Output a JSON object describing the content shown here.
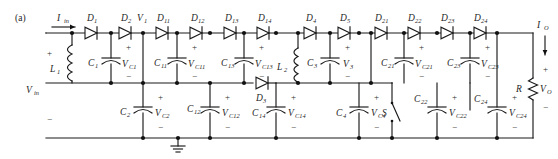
{
  "figure": {
    "panel_label": "(a)",
    "type": "schematic-circuit-diagram"
  },
  "colors": {
    "wire": "#1a1a1a",
    "node": "#111111",
    "text": "#262626",
    "background": "#ffffff"
  },
  "labels": {
    "i_in": "I",
    "i_in_sub": "in",
    "i_out": "I",
    "i_out_sub": "O",
    "v_in": "V",
    "v_in_sub": "in",
    "v_out": "V",
    "v_out_sub": "O",
    "plus": "+",
    "minus": "−",
    "resistor": "R",
    "switch": "S",
    "v1": "V",
    "v1_sub": "1",
    "v3": "V",
    "v3_sub": "3"
  },
  "diodes": [
    {
      "name": "D",
      "sub": "1",
      "x": 92,
      "y": 33
    },
    {
      "name": "D",
      "sub": "2",
      "x": 126,
      "y": 33
    },
    {
      "name": "D",
      "sub": "11",
      "x": 164,
      "y": 33
    },
    {
      "name": "D",
      "sub": "12",
      "x": 199,
      "y": 33
    },
    {
      "name": "D",
      "sub": "13",
      "x": 233,
      "y": 33
    },
    {
      "name": "D",
      "sub": "14",
      "x": 266,
      "y": 33
    },
    {
      "name": "D",
      "sub": "4",
      "x": 311,
      "y": 33
    },
    {
      "name": "D",
      "sub": "5",
      "x": 345,
      "y": 33
    },
    {
      "name": "D",
      "sub": "21",
      "x": 382,
      "y": 33
    },
    {
      "name": "D",
      "sub": "22",
      "x": 415,
      "y": 33
    },
    {
      "name": "D",
      "sub": "23",
      "x": 448,
      "y": 33
    },
    {
      "name": "D",
      "sub": "24",
      "x": 481,
      "y": 33
    },
    {
      "name": "D",
      "sub": "3",
      "x": 263,
      "y": 99
    }
  ],
  "inductors": [
    {
      "name": "L",
      "sub": "1",
      "x": 59,
      "y": 66
    },
    {
      "name": "L",
      "sub": "2",
      "x": 285,
      "y": 66
    }
  ],
  "capacitors_upper": [
    {
      "name": "C",
      "sub": "1",
      "volt": "V",
      "volt_sub": "C1"
    },
    {
      "name": "C",
      "sub": "11",
      "volt": "V",
      "volt_sub": "C11"
    },
    {
      "name": "C",
      "sub": "13",
      "volt": "V",
      "volt_sub": "C13"
    },
    {
      "name": "C",
      "sub": "3",
      "volt": "V",
      "volt_sub": "3"
    },
    {
      "name": "C",
      "sub": "21",
      "volt": "V",
      "volt_sub": "C21"
    },
    {
      "name": "C",
      "sub": "23",
      "volt": "V",
      "volt_sub": "C23"
    }
  ],
  "capacitors_lower": [
    {
      "name": "C",
      "sub": "2",
      "volt": "V",
      "volt_sub": "C2"
    },
    {
      "name": "C",
      "sub": "12",
      "volt": "V",
      "volt_sub": "C12"
    },
    {
      "name": "C",
      "sub": "14",
      "volt": "V",
      "volt_sub": "C14"
    },
    {
      "name": "C",
      "sub": "4",
      "volt": "V",
      "volt_sub": "C4"
    },
    {
      "name": "C",
      "sub": "22",
      "volt": "V",
      "volt_sub": "C22"
    },
    {
      "name": "C",
      "sub": "24",
      "volt": "V",
      "volt_sub": "C24"
    }
  ],
  "ground": {
    "present": true,
    "x": 178,
    "y": 138
  }
}
